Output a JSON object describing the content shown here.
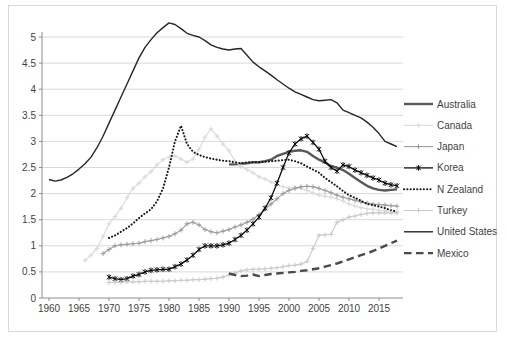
{
  "figure": {
    "background": "#ffffff",
    "border_color": "#d9d9d9",
    "gridline_color": "#d9d9d9",
    "axis_color": "#8c8c8c",
    "tick_label_color": "#3f3f3f"
  },
  "chart_data": {
    "type": "line",
    "title": "",
    "xlabel": "",
    "ylabel": "",
    "x_range": [
      1958.8,
      2019.2
    ],
    "y_range": [
      0,
      5.5
    ],
    "x_ticks": [
      1960,
      1965,
      1970,
      1975,
      1980,
      1985,
      1990,
      1995,
      2000,
      2005,
      2010,
      2015
    ],
    "y_ticks": [
      0,
      0.5,
      1,
      1.5,
      2,
      2.5,
      3,
      3.5,
      4,
      4.5,
      5
    ],
    "y_tick_labels": [
      "0",
      "0.5",
      "1",
      "1.5",
      "2",
      "2.5",
      "3",
      "3.5",
      "4",
      "4.5",
      "5"
    ],
    "grid": "horizontal",
    "legend_position": "right",
    "series": [
      {
        "name": "Australia",
        "color": "#595959",
        "width": 2.4,
        "style": "solid",
        "marker": "",
        "start_year": 1990,
        "values": [
          2.56,
          2.56,
          2.57,
          2.58,
          2.6,
          2.6,
          2.62,
          2.65,
          2.72,
          2.76,
          2.8,
          2.82,
          2.83,
          2.8,
          2.72,
          2.65,
          2.6,
          2.52,
          2.5,
          2.45,
          2.38,
          2.3,
          2.22,
          2.15,
          2.1,
          2.07,
          2.06,
          2.07,
          2.08
        ]
      },
      {
        "name": "Canada",
        "color": "#d9d9d9",
        "width": 1.1,
        "style": "solid",
        "marker": "plus",
        "start_year": 1966,
        "values": [
          0.72,
          0.82,
          0.95,
          1.18,
          1.42,
          1.56,
          1.72,
          1.92,
          2.1,
          2.2,
          2.32,
          2.42,
          2.55,
          2.65,
          2.7,
          2.72,
          2.66,
          2.6,
          2.66,
          2.85,
          3.08,
          3.24,
          3.1,
          2.95,
          2.82,
          2.62,
          2.52,
          2.46,
          2.4,
          2.32,
          2.28,
          2.22,
          2.17,
          2.13,
          2.1,
          2.12,
          2.1,
          2.06,
          2.01,
          1.97,
          1.95,
          1.93,
          1.9,
          1.86,
          1.8,
          1.76,
          1.73,
          1.71,
          1.7,
          1.68,
          1.67,
          1.66,
          1.65
        ]
      },
      {
        "name": "Japan",
        "color": "#9a9a9a",
        "width": 1.1,
        "style": "solid",
        "marker": "plus",
        "start_year": 1969,
        "values": [
          0.85,
          0.93,
          1.0,
          1.02,
          1.03,
          1.04,
          1.05,
          1.08,
          1.1,
          1.12,
          1.15,
          1.18,
          1.23,
          1.3,
          1.42,
          1.45,
          1.4,
          1.31,
          1.27,
          1.25,
          1.28,
          1.31,
          1.36,
          1.4,
          1.45,
          1.51,
          1.6,
          1.7,
          1.8,
          1.9,
          2.0,
          2.06,
          2.1,
          2.13,
          2.14,
          2.13,
          2.1,
          2.06,
          2.02,
          1.97,
          1.93,
          1.9,
          1.87,
          1.84,
          1.82,
          1.8,
          1.79,
          1.78,
          1.77,
          1.76
        ]
      },
      {
        "name": "Korea",
        "color": "#0d0d0d",
        "width": 1.3,
        "style": "solid",
        "marker": "star",
        "start_year": 1970,
        "values": [
          0.4,
          0.37,
          0.35,
          0.37,
          0.42,
          0.45,
          0.5,
          0.53,
          0.54,
          0.55,
          0.55,
          0.6,
          0.65,
          0.73,
          0.82,
          0.93,
          1.0,
          1.0,
          1.0,
          1.02,
          1.05,
          1.12,
          1.2,
          1.3,
          1.42,
          1.55,
          1.72,
          1.92,
          2.2,
          2.5,
          2.78,
          2.95,
          3.05,
          3.1,
          2.98,
          2.85,
          2.62,
          2.5,
          2.43,
          2.55,
          2.52,
          2.45,
          2.4,
          2.35,
          2.3,
          2.26,
          2.2,
          2.17,
          2.15
        ]
      },
      {
        "name": "N Zealand",
        "color": "#1a1a1a",
        "width": 2.1,
        "style": "dotted",
        "marker": "",
        "start_year": 1970,
        "values": [
          1.15,
          1.2,
          1.27,
          1.34,
          1.43,
          1.53,
          1.62,
          1.7,
          1.85,
          2.1,
          2.5,
          3.0,
          3.3,
          2.95,
          2.8,
          2.74,
          2.7,
          2.67,
          2.65,
          2.63,
          2.62,
          2.6,
          2.58,
          2.6,
          2.6,
          2.6,
          2.61,
          2.62,
          2.63,
          2.64,
          2.65,
          2.62,
          2.58,
          2.52,
          2.46,
          2.4,
          2.3,
          2.22,
          2.14,
          2.05,
          1.97,
          1.92,
          1.86,
          1.8,
          1.78,
          1.75,
          1.72,
          1.68,
          1.66
        ]
      },
      {
        "name": "Turkey",
        "color": "#c9c9c9",
        "width": 1.1,
        "style": "solid",
        "marker": "plus",
        "start_year": 1970,
        "values": [
          0.3,
          0.3,
          0.3,
          0.31,
          0.31,
          0.31,
          0.32,
          0.32,
          0.32,
          0.32,
          0.33,
          0.33,
          0.34,
          0.34,
          0.35,
          0.35,
          0.36,
          0.37,
          0.38,
          0.4,
          0.44,
          0.48,
          0.52,
          0.54,
          0.55,
          0.55,
          0.56,
          0.57,
          0.58,
          0.6,
          0.62,
          0.63,
          0.65,
          0.7,
          0.95,
          1.2,
          1.21,
          1.22,
          1.45,
          1.5,
          1.55,
          1.57,
          1.6,
          1.62,
          1.63,
          1.63,
          1.63,
          1.63,
          1.63
        ]
      },
      {
        "name": "United States",
        "color": "#262626",
        "width": 1.4,
        "style": "solid",
        "marker": "",
        "start_year": 1960,
        "values": [
          2.27,
          2.24,
          2.26,
          2.31,
          2.38,
          2.47,
          2.57,
          2.7,
          2.88,
          3.1,
          3.35,
          3.6,
          3.85,
          4.1,
          4.35,
          4.6,
          4.8,
          4.95,
          5.08,
          5.18,
          5.27,
          5.24,
          5.16,
          5.07,
          5.03,
          5.0,
          4.93,
          4.85,
          4.8,
          4.77,
          4.75,
          4.77,
          4.78,
          4.65,
          4.52,
          4.43,
          4.35,
          4.27,
          4.18,
          4.1,
          4.02,
          3.95,
          3.9,
          3.85,
          3.8,
          3.78,
          3.79,
          3.8,
          3.74,
          3.6,
          3.55,
          3.5,
          3.45,
          3.37,
          3.27,
          3.15,
          3.0,
          2.95,
          2.9
        ]
      },
      {
        "name": "Mexico",
        "color": "#4a4a4a",
        "width": 2.4,
        "style": "dashed",
        "marker": "",
        "start_year": 1990,
        "values": [
          0.47,
          0.44,
          0.42,
          0.43,
          0.45,
          0.42,
          0.44,
          0.46,
          0.47,
          0.48,
          0.49,
          0.5,
          0.52,
          0.53,
          0.55,
          0.57,
          0.6,
          0.63,
          0.66,
          0.7,
          0.74,
          0.78,
          0.82,
          0.86,
          0.9,
          0.95,
          1.0,
          1.05,
          1.1
        ]
      }
    ]
  }
}
